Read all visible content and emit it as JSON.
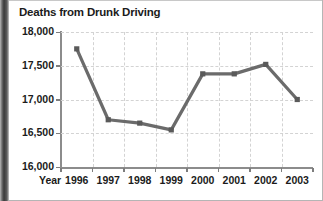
{
  "figure": {
    "title": "Deaths from Drunk Driving",
    "x_axis_caption": "Year"
  },
  "chart_data": {
    "type": "line",
    "title": "Deaths from Drunk Driving",
    "xlabel": "Year",
    "ylabel": "",
    "categories": [
      "1996",
      "1997",
      "1998",
      "1999",
      "2000",
      "2001",
      "2002",
      "2003"
    ],
    "values": [
      17750,
      16700,
      16650,
      16550,
      17380,
      17380,
      17520,
      17000
    ],
    "series": [
      {
        "name": "Deaths from Drunk Driving",
        "values": [
          17750,
          16700,
          16650,
          16550,
          17380,
          17380,
          17520,
          17000
        ]
      }
    ],
    "ylim": [
      16000,
      18000
    ],
    "ytick_labels": [
      "18,000",
      "17,500",
      "17,000",
      "16,500",
      "16,000"
    ],
    "ytick_values": [
      18000,
      17500,
      17000,
      16500,
      16000
    ],
    "xtick_labels": [
      "1996",
      "1997",
      "1998",
      "1999",
      "2000",
      "2001",
      "2002",
      "2003"
    ],
    "grid": true,
    "grid_style": "dashed",
    "legend": false,
    "line_color": "#6b6b6b",
    "marker": "square",
    "marker_color": "#5a5a5a"
  },
  "colors": {
    "line": "#6b6b6b",
    "marker": "#595959",
    "grid": "#d3d3d3",
    "axis": "#8c8c8c",
    "text": "#1b1b1b",
    "background": "#ffffff"
  }
}
